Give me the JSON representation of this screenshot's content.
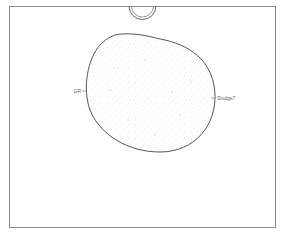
{
  "diagram": {
    "labels": {
      "left": "GR",
      "right": "Sludge7"
    },
    "colors": {
      "frame": "#8a8a8a",
      "outline": "#555555",
      "stipple": "#b8b8b8",
      "label": "#666666",
      "background": "#ffffff"
    }
  }
}
